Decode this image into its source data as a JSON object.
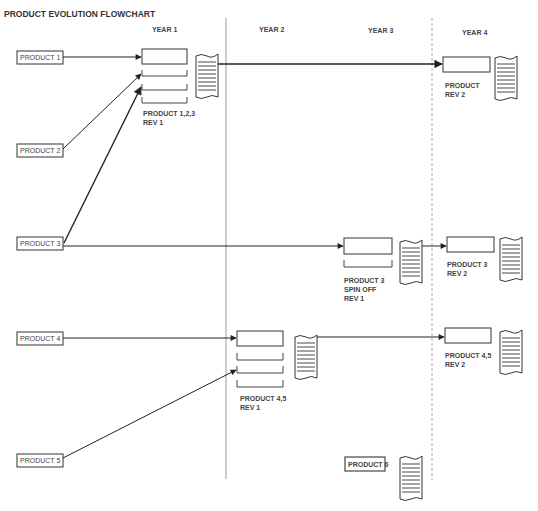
{
  "title": "PRODUCT EVOLUTION FLOWCHART",
  "years": [
    {
      "label": "YEAR 1"
    },
    {
      "label": "YEAR 2"
    },
    {
      "label": "YEAR 3"
    },
    {
      "label": "YEAR 4"
    }
  ],
  "inputs": [
    {
      "label": "PRODUCT 1"
    },
    {
      "label": "PRODUCT 2"
    },
    {
      "label": "PRODUCT 3"
    },
    {
      "label": "PRODUCT 4"
    },
    {
      "label": "PRODUCT 5"
    },
    {
      "label": "PRODUCT 6"
    }
  ],
  "revisions": [
    {
      "line1": "PRODUCT 1,2,3",
      "line2": "REV 1",
      "line3": ""
    },
    {
      "line1": "PRODUCT",
      "line2": "REV 2",
      "line3": ""
    },
    {
      "line1": "PRODUCT 3",
      "line2": "SPIN OFF",
      "line3": "REV 1"
    },
    {
      "line1": "PRODUCT 3",
      "line2": "REV 2",
      "line3": ""
    },
    {
      "line1": "PRODUCT 4,5",
      "line2": "REV 1",
      "line3": ""
    },
    {
      "line1": "PRODUCT 4,5",
      "line2": "REV 2",
      "line3": ""
    }
  ],
  "colors": {
    "stroke": "#222222",
    "divider": "#999999",
    "text": "#444444"
  }
}
